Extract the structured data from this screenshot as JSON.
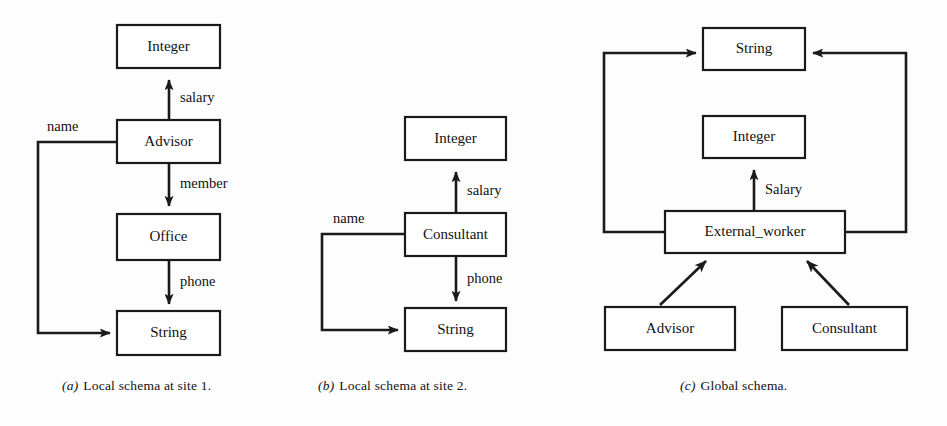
{
  "figure": {
    "background_color": "#fdfdfd",
    "line_color": "#1a1a1a",
    "box_fill": "#ffffff"
  },
  "panels": [
    {
      "id": "a",
      "caption_tag": "(a)",
      "caption_text": "Local schema at site 1.",
      "entities": [
        {
          "name": "Integer",
          "label": "Integer"
        },
        {
          "name": "Advisor",
          "label": "Advisor"
        },
        {
          "name": "Office",
          "label": "Office"
        },
        {
          "name": "String",
          "label": "String"
        }
      ],
      "edges": [
        {
          "label": "salary",
          "from": "Advisor",
          "to": "Integer"
        },
        {
          "label": "member",
          "from": "Advisor",
          "to": "Office"
        },
        {
          "label": "phone",
          "from": "Office",
          "to": "String"
        },
        {
          "label": "name",
          "from": "Advisor",
          "to": "String"
        }
      ]
    },
    {
      "id": "b",
      "caption_tag": "(b)",
      "caption_text": "Local schema at site 2.",
      "entities": [
        {
          "name": "Integer",
          "label": "Integer"
        },
        {
          "name": "Consultant",
          "label": "Consultant"
        },
        {
          "name": "String",
          "label": "String"
        }
      ],
      "edges": [
        {
          "label": "salary",
          "from": "Consultant",
          "to": "Integer"
        },
        {
          "label": "phone",
          "from": "Consultant",
          "to": "String"
        },
        {
          "label": "name",
          "from": "Consultant",
          "to": "String"
        }
      ]
    },
    {
      "id": "c",
      "caption_tag": "(c)",
      "caption_text": "Global schema.",
      "entities": [
        {
          "name": "String",
          "label": "String"
        },
        {
          "name": "Integer",
          "label": "Integer"
        },
        {
          "name": "External_worker",
          "label": "External_worker"
        },
        {
          "name": "Advisor",
          "label": "Advisor"
        },
        {
          "name": "Consultant",
          "label": "Consultant"
        }
      ],
      "edges": [
        {
          "label": "Salary",
          "from": "External_worker",
          "to": "Integer"
        },
        {
          "label": "",
          "from": "External_worker",
          "to": "String"
        },
        {
          "label": "",
          "from": "External_worker",
          "to": "String"
        },
        {
          "label": "",
          "from": "Advisor",
          "to": "External_worker"
        },
        {
          "label": "",
          "from": "Consultant",
          "to": "External_worker"
        }
      ]
    }
  ],
  "labels": {
    "a_integer": "Integer",
    "a_advisor": "Advisor",
    "a_office": "Office",
    "a_string": "String",
    "a_salary": "salary",
    "a_member": "member",
    "a_phone": "phone",
    "a_name": "name",
    "b_integer": "Integer",
    "b_consultant": "Consultant",
    "b_string": "String",
    "b_salary": "salary",
    "b_phone": "phone",
    "b_name": "name",
    "c_string": "String",
    "c_integer": "Integer",
    "c_external_worker": "External_worker",
    "c_advisor": "Advisor",
    "c_consultant": "Consultant",
    "c_salary": "Salary"
  },
  "captions": {
    "a_tag": "(a)",
    "a_text": "Local schema at site 1.",
    "b_tag": "(b)",
    "b_text": "Local schema at site 2.",
    "c_tag": "(c)",
    "c_text": "Global schema."
  }
}
